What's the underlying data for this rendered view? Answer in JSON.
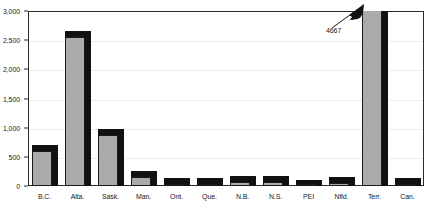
{
  "chart_data": {
    "type": "bar",
    "title": "",
    "xlabel": "",
    "ylabel": "",
    "ylim": [
      0,
      3000
    ],
    "grid": true,
    "legend": "none",
    "categories": [
      "B.C.",
      "Alta.",
      "Sask.",
      "Man.",
      "Ont.",
      "Que.",
      "N.B.",
      "N.S.",
      "PEI",
      "Nfld.",
      "Terr.",
      "Can."
    ],
    "values": [
      700,
      2650,
      980,
      250,
      130,
      140,
      170,
      170,
      110,
      160,
      4667,
      130
    ],
    "y_ticks": [
      0,
      500,
      1000,
      1500,
      2000,
      2500,
      3000
    ],
    "y_tick_labels": [
      "0",
      "500",
      "1,000",
      "1,500",
      "2,000",
      "2,500",
      "3,000"
    ],
    "annotations": [
      {
        "label": "4667",
        "target_category": "Terr.",
        "note": "bar exceeds axis maximum and is clipped at 3,000"
      }
    ],
    "style": {
      "bar_face_color": "#ababab",
      "bar_depth_color": "#111111",
      "bar_outline_color": "#1a1a1a",
      "gridline_color": "#ededed",
      "axis_color": "#2b2b2b",
      "background_color": "#ffffff"
    }
  }
}
